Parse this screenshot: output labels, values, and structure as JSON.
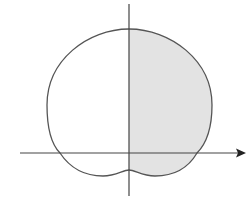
{
  "diagram": {
    "type": "polar-curve",
    "shaded_region": "right half (x >= 0)",
    "colors": {
      "curve": "#555555",
      "axes": "#444444",
      "shade": "#e3e3e3",
      "background": "#ffffff"
    },
    "axes": {
      "horizontal": {
        "has_arrow": true,
        "direction": "right"
      },
      "vertical": {
        "has_arrow": false
      }
    },
    "labels": []
  }
}
